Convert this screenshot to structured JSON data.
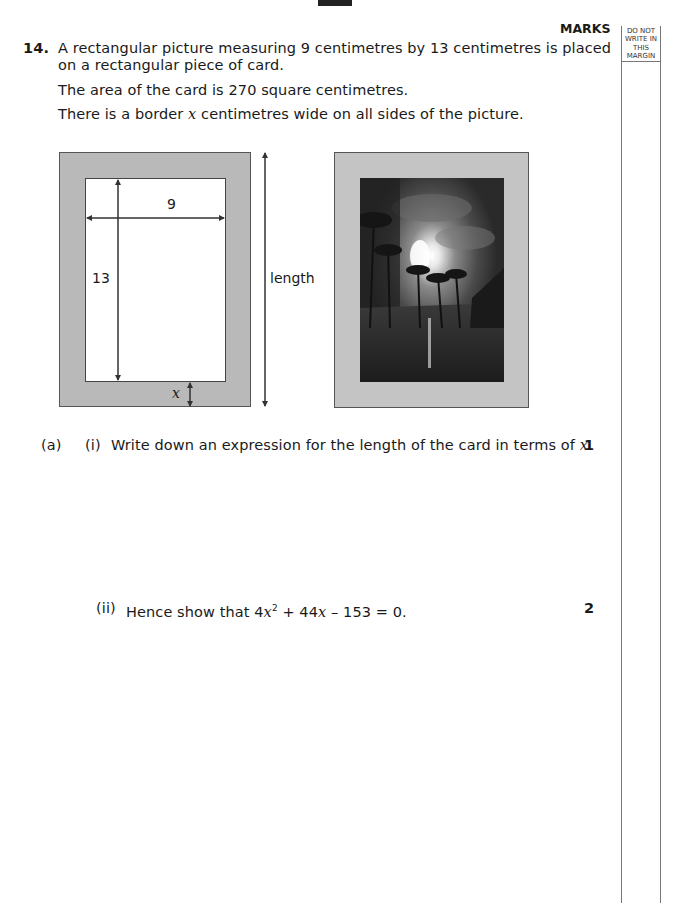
{
  "header": {
    "marks_label": "MARKS",
    "margin_label": [
      "DO NOT",
      "WRITE IN",
      "THIS",
      "MARGIN"
    ]
  },
  "question": {
    "number": "14.",
    "intro_line1": "A rectangular picture measuring 9 centimetres by 13 centimetres is placed",
    "intro_line2": "on a rectangular piece of card.",
    "area_line": "The area of the card is 270 square centimetres.",
    "border_line_pre": "There is a border ",
    "border_var": "x",
    "border_line_post": " centimetres wide on all sides of the picture."
  },
  "diagram": {
    "width_label": "9",
    "height_label": "13",
    "length_label": "length",
    "border_label": "x",
    "colors": {
      "card": "#b9b9b9",
      "picture": "#ffffff",
      "frame2": "#c4c4c4"
    },
    "photo_description": "night-time tropical scene with palm trees, bright moon through clouds, reflection in water"
  },
  "parts": [
    {
      "part": "(a)",
      "sub": "(i)",
      "text_pre": "Write down an expression for the length of the card in terms of ",
      "text_var": "x",
      "text_post": ".",
      "marks": "1"
    },
    {
      "sub": "(ii)",
      "text_pre": "Hence show that ",
      "eq_coef1": "4",
      "eq_var1": "x",
      "eq_exp": "2",
      "eq_mid": " + 44",
      "eq_var2": "x",
      "eq_end": " – 153 = 0.",
      "marks": "2"
    }
  ]
}
